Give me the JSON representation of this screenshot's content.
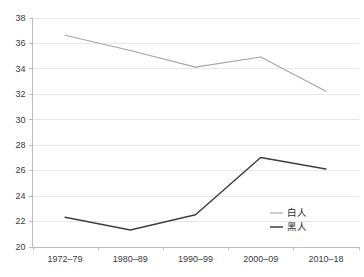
{
  "chart_data": {
    "type": "line",
    "title": "",
    "subtitle": "",
    "xlabel": "",
    "ylabel": "",
    "categories": [
      "1972–79",
      "1980–89",
      "1990–99",
      "2000–09",
      "2010–18"
    ],
    "series": [
      {
        "name": "白人",
        "values": [
          36.6,
          35.4,
          34.1,
          34.9,
          32.2
        ],
        "color": "#a6a6a6"
      },
      {
        "name": "黑人",
        "values": [
          22.3,
          21.3,
          22.5,
          27.0,
          26.1
        ],
        "color": "#3f3f3f"
      }
    ],
    "ylim": [
      20,
      38
    ],
    "ytick_step": 2,
    "ytick_labels": [
      "20",
      "22",
      "24",
      "26",
      "28",
      "30",
      "32",
      "34",
      "36",
      "38"
    ],
    "grid": true,
    "grid_axis": "y",
    "grid_color": "#e8e8e8",
    "axis_color": "#bdbdbd",
    "legend_position": "inside-bottom-right",
    "background": "#ffffff"
  },
  "legend": {
    "entries": [
      {
        "label": "白人"
      },
      {
        "label": "黑人"
      }
    ]
  }
}
